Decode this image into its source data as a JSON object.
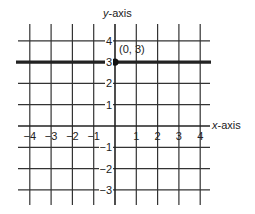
{
  "chart_data": {
    "type": "line",
    "title": "",
    "xlabel": "x-axis",
    "ylabel": "y-axis",
    "xlim": [
      -4.4,
      4.4
    ],
    "ylim": [
      -3.6,
      4.6
    ],
    "grid": true,
    "x_ticks": [
      -4,
      -3,
      -2,
      -1,
      1,
      2,
      3,
      4
    ],
    "y_ticks": [
      4,
      3,
      2,
      1,
      -1,
      -2,
      -3
    ],
    "x_tick_labels": [
      "−4",
      "−3",
      "−2",
      "−1",
      "1",
      "2",
      "3",
      "4"
    ],
    "y_tick_labels": [
      "4",
      "3",
      "2",
      "1",
      "−1",
      "−2",
      "−3"
    ],
    "series": [
      {
        "name": "y = 3",
        "kind": "horizontal-line",
        "x": [
          -4.4,
          4.4
        ],
        "y": [
          3,
          3
        ],
        "color": "#222222"
      }
    ],
    "points": [
      {
        "x": 0,
        "y": 3,
        "label": "(0, 3)"
      }
    ],
    "annotations": [
      {
        "text": "(0, 3)",
        "x": 0,
        "y": 3
      }
    ]
  },
  "labels": {
    "x_axis": "x-axis",
    "y_axis": "y-axis",
    "point": "(0, 3)"
  }
}
